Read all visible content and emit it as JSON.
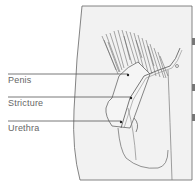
{
  "diagram": {
    "labels": [
      {
        "text": "Penis",
        "x": 8,
        "y": 76
      },
      {
        "text": "Stricture",
        "x": 8,
        "y": 97
      },
      {
        "text": "Urethra",
        "x": 8,
        "y": 123
      }
    ],
    "colors": {
      "background": "#ffffff",
      "panel": "#f2f2f2",
      "line": "#555555",
      "label_text": "#666666"
    }
  }
}
